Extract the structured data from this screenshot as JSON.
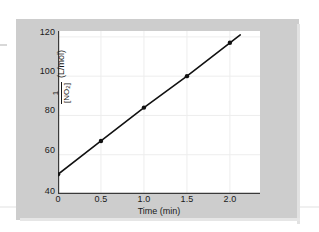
{
  "figure": {
    "background_color": "#cdcdcd",
    "plot_background_color": "#ffffff",
    "line_color": "#111111",
    "marker_color": "#111111",
    "grid_color": "#ededed",
    "axis_color": "#3a3a3a"
  },
  "axes": {
    "y_title_numerator": "1",
    "y_title_denominator": "[NO",
    "y_title_denominator_sub": "2",
    "y_title_denominator_end": "]",
    "y_units": "(L/mol)",
    "x_title": "Time (min)"
  },
  "chart_data": {
    "type": "line",
    "title": "",
    "xlabel": "Time (min)",
    "ylabel": "1/[NO2] (L/mol)",
    "x": [
      0,
      0.5,
      1.0,
      1.5,
      2.0
    ],
    "values": [
      50,
      67,
      84,
      100,
      117
    ],
    "series": [
      {
        "name": "1/[NO2] vs time",
        "values": [
          50,
          67,
          84,
          100,
          117
        ]
      }
    ],
    "xlim": [
      0,
      2.35
    ],
    "ylim": [
      40,
      123
    ],
    "xticks": [
      0,
      0.5,
      1.0,
      1.5,
      2.0
    ],
    "xticklabels": [
      "0",
      "0.5",
      "1.0",
      "1.5",
      "2.0"
    ],
    "yticks": [
      40,
      60,
      80,
      100,
      120
    ],
    "yticklabels": [
      "40",
      "60",
      "80",
      "100",
      "120"
    ],
    "grid": true,
    "legend": false,
    "markers": "filled-circle",
    "line_extends_past_last_point": true
  }
}
